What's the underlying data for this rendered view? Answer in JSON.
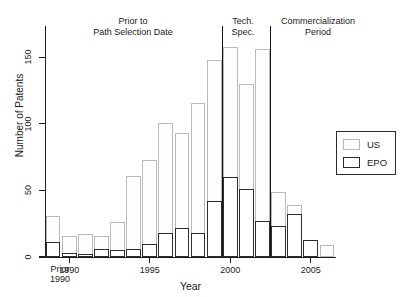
{
  "chart_data": {
    "type": "bar",
    "title": "",
    "subtitle": "",
    "xlabel": "Year",
    "ylabel": "Number of Patents",
    "xlim": [
      -1,
      17
    ],
    "ylim": [
      0,
      165
    ],
    "yticks": [
      0,
      50,
      100,
      150
    ],
    "ytick_labels": [
      "0",
      "50",
      "100",
      "150"
    ],
    "xticks": [
      1990,
      1995,
      2000,
      2005
    ],
    "xtick_labels": [
      "1990",
      "1995",
      "2000",
      "2005"
    ],
    "grid": false,
    "legend_position": "right",
    "categories": [
      "Prior 1990",
      "1990",
      "1991",
      "1992",
      "1993",
      "1994",
      "1995",
      "1996",
      "1997",
      "1998",
      "1999",
      "2000",
      "2001",
      "2002",
      "2003",
      "2004",
      "2005",
      "2006"
    ],
    "series": [
      {
        "name": "US",
        "color": "#fdfdfd",
        "edge_color": "#b9b9b9",
        "values": [
          31,
          16,
          17,
          16,
          26,
          61,
          73,
          101,
          93,
          116,
          148,
          158,
          130,
          156,
          49,
          39,
          13,
          9
        ]
      },
      {
        "name": "EPO",
        "color": "#ffffff",
        "edge_color": "#2e2e2e",
        "values": [
          11,
          3,
          2,
          6,
          5,
          6,
          10,
          18,
          22,
          18,
          42,
          60,
          51,
          27,
          23,
          32,
          13,
          0
        ]
      }
    ],
    "annotations": [
      {
        "text_line1": "Prior to",
        "text_line2": "Path Selection Date",
        "x_center": 133
      },
      {
        "text_line1": "Tech.",
        "text_line2": "Spec.",
        "x_center": 243
      },
      {
        "text_line1": "Commercialization",
        "text_line2": "Period",
        "x_center": 318
      }
    ],
    "dividers": [
      1999.5,
      2002.5
    ]
  },
  "axis": {
    "y_title": "Number of Patents",
    "x_title": "Year",
    "prior_label_line1": "Prior",
    "prior_label_line2": "1990"
  },
  "legend": {
    "items": [
      {
        "label": "US"
      },
      {
        "label": "EPO"
      }
    ]
  }
}
